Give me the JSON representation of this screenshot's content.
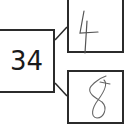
{
  "diagram": {
    "type": "number-bond",
    "whole": {
      "value": "34"
    },
    "parts": [
      {
        "value": "4",
        "style": "handwritten"
      },
      {
        "value": "8",
        "style": "handwritten"
      }
    ],
    "colors": {
      "stroke": "#2b2b2b",
      "handwriting": "#555555",
      "background": "#ffffff"
    }
  }
}
